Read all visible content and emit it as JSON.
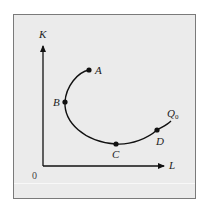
{
  "diagram": {
    "type": "isoquant",
    "axes": {
      "x_label": "L",
      "y_label": "K",
      "origin_label": "0"
    },
    "curve": {
      "label": "Q",
      "label_subscript": "0"
    },
    "points": [
      {
        "id": "A",
        "label": "A"
      },
      {
        "id": "B",
        "label": "B"
      },
      {
        "id": "C",
        "label": "C"
      },
      {
        "id": "D",
        "label": "D"
      }
    ],
    "colors": {
      "panel_background": "#ebebeb",
      "border": "#7a7a7a",
      "ink": "#111111"
    }
  }
}
